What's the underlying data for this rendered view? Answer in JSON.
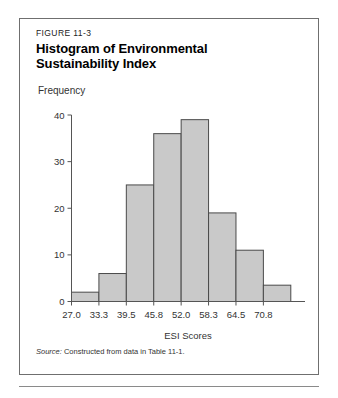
{
  "figure": {
    "number": "FIGURE 11-3",
    "title_line1": "Histogram of Environmental",
    "title_line2": "Sustainability Index",
    "source_label": "Source:",
    "source_text": " Constructed from data in Table 11-1."
  },
  "chart_data": {
    "type": "bar",
    "title": "Histogram of Environmental Sustainability Index",
    "xlabel": "ESI Scores",
    "ylabel": "Frequency",
    "categories": [
      "27.0",
      "33.3",
      "39.5",
      "45.8",
      "52.0",
      "58.3",
      "64.5",
      "70.8"
    ],
    "values": [
      2,
      6,
      25,
      36,
      39,
      19,
      11,
      3.5
    ],
    "ylim": [
      0,
      40
    ],
    "yticks": [
      "0",
      "10",
      "20",
      "30",
      "40"
    ],
    "ytick_values": [
      0,
      10,
      20,
      30,
      40
    ],
    "grid": false,
    "legend": "none",
    "bar_fill": "#c9c9c9",
    "bar_stroke": "#4a4a4a",
    "axis_color": "#555555"
  }
}
